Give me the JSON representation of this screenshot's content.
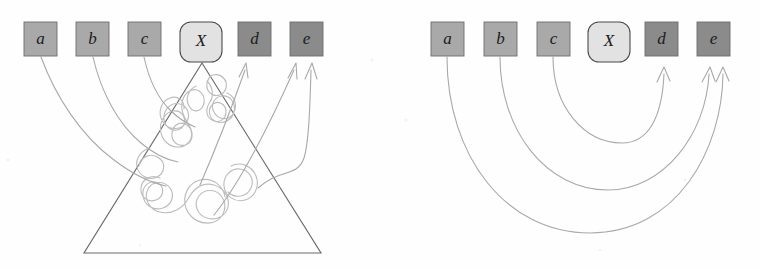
{
  "figure": {
    "caption": "",
    "background_color": "#fefefe",
    "width": 760,
    "height": 269
  },
  "colors": {
    "box_light": "#a9a9a9",
    "box_dark": "#8b8b8b",
    "box_x": "#e2e2e2",
    "box_border": "#6e6e6e",
    "box_x_border": "#4a4a4a",
    "label_text": "#1c1c1c",
    "triangle_stroke": "#6a6a6a",
    "blob_stroke": "#bdbdbd",
    "arrow_stroke": "#a9a9a9"
  },
  "panels": [
    {
      "id": "left-panel",
      "name": "scope-cone-panel",
      "nodes": [
        {
          "id": "a",
          "label": "a",
          "shape": "square",
          "fill": "#a9a9a9",
          "x": 24,
          "y": 22,
          "w": 33,
          "h": 34
        },
        {
          "id": "b",
          "label": "b",
          "shape": "square",
          "fill": "#a9a9a9",
          "x": 76,
          "y": 22,
          "w": 33,
          "h": 34
        },
        {
          "id": "c",
          "label": "c",
          "shape": "square",
          "fill": "#a9a9a9",
          "x": 128,
          "y": 22,
          "w": 33,
          "h": 34
        },
        {
          "id": "X",
          "label": "X",
          "shape": "rounded",
          "fill": "#e2e2e2",
          "x": 180,
          "y": 22,
          "w": 42,
          "h": 40
        },
        {
          "id": "d",
          "label": "d",
          "shape": "square",
          "fill": "#8b8b8b",
          "x": 238,
          "y": 22,
          "w": 33,
          "h": 34
        },
        {
          "id": "e",
          "label": "e",
          "shape": "square",
          "fill": "#8b8b8b",
          "x": 290,
          "y": 22,
          "w": 33,
          "h": 34
        }
      ],
      "triangle": {
        "apex_x": 202,
        "apex_y": 63,
        "base_y": 253,
        "base_left_x": 84,
        "base_right_x": 321
      },
      "blob": {
        "description": "irregular amoeba-shaped closed curve inside triangle"
      },
      "edges": [
        {
          "from": "a",
          "to": "blob",
          "arrowhead": false
        },
        {
          "from": "b",
          "to": "blob",
          "arrowhead": false
        },
        {
          "from": "c",
          "to": "blob",
          "arrowhead": false
        },
        {
          "from": "blob",
          "to": "d",
          "arrowhead": true
        },
        {
          "from": "blob",
          "to": "e",
          "arrowhead": true
        },
        {
          "from": "blob",
          "to": "e",
          "arrowhead": true
        }
      ]
    },
    {
      "id": "right-panel",
      "name": "direct-arcs-panel",
      "nodes": [
        {
          "id": "a",
          "label": "a",
          "shape": "square",
          "fill": "#a9a9a9",
          "x": 431,
          "y": 22,
          "w": 33,
          "h": 34
        },
        {
          "id": "b",
          "label": "b",
          "shape": "square",
          "fill": "#a9a9a9",
          "x": 484,
          "y": 22,
          "w": 33,
          "h": 34
        },
        {
          "id": "c",
          "label": "c",
          "shape": "square",
          "fill": "#a9a9a9",
          "x": 537,
          "y": 22,
          "w": 33,
          "h": 34
        },
        {
          "id": "X",
          "label": "X",
          "shape": "rounded",
          "fill": "#e2e2e2",
          "x": 588,
          "y": 22,
          "w": 42,
          "h": 40
        },
        {
          "id": "d",
          "label": "d",
          "shape": "square",
          "fill": "#8b8b8b",
          "x": 645,
          "y": 22,
          "w": 33,
          "h": 34
        },
        {
          "id": "e",
          "label": "e",
          "shape": "square",
          "fill": "#8b8b8b",
          "x": 697,
          "y": 22,
          "w": 33,
          "h": 34
        }
      ],
      "edges": [
        {
          "from": "c",
          "to": "d",
          "arrowhead": true
        },
        {
          "from": "b",
          "to": "e",
          "arrowhead": true
        },
        {
          "from": "a",
          "to": "e",
          "arrowhead": true
        }
      ]
    }
  ]
}
